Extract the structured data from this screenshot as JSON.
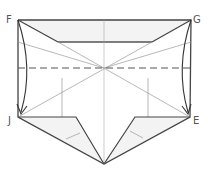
{
  "diagram": {
    "labels": {
      "top_left": "F",
      "top_right": "G",
      "bottom_left": "J",
      "bottom_right": "E"
    },
    "colors": {
      "stroke": "#333333",
      "thin": "#888888",
      "fill": "#f2f2f2",
      "background": "#ffffff"
    }
  }
}
